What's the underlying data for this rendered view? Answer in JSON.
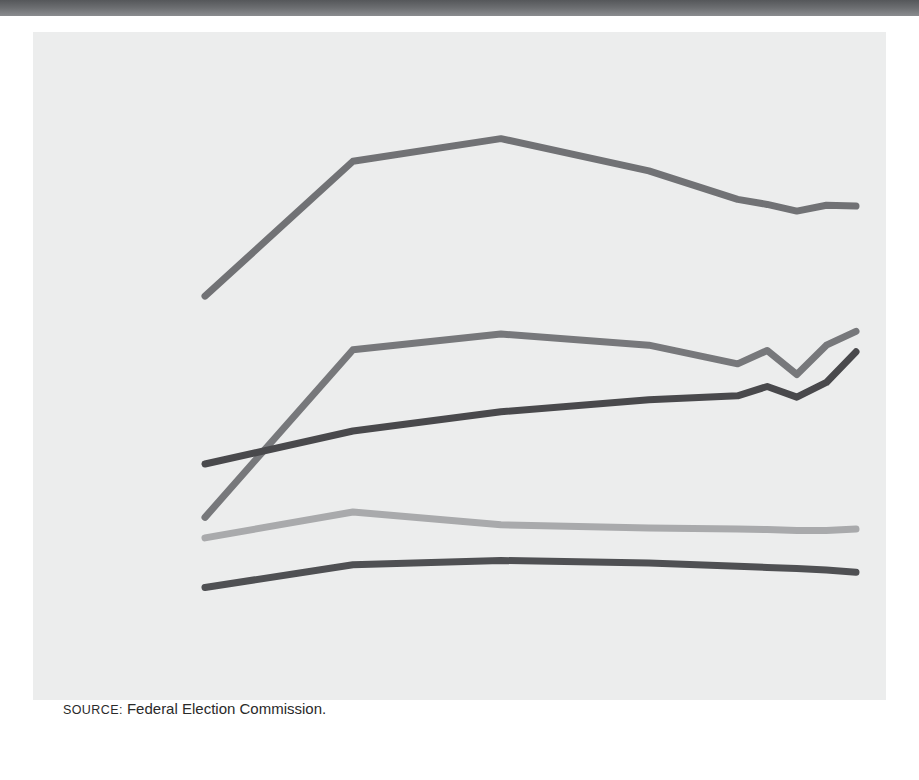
{
  "figure": {
    "source_prefix": "SOURCE:",
    "source_text": "Federal Election Commission.",
    "panel_color": "#eceded",
    "rule_color": "#6a6c6f"
  },
  "chart_data": {
    "type": "line",
    "title": "",
    "xlabel": "YEAR",
    "ylabel_line1": "NUMBER",
    "ylabel_line2": "OF PACS",
    "ylabel": "NUMBER OF PACS",
    "x": [
      1980,
      1985,
      1990,
      1995,
      1998,
      1999,
      2000,
      2001,
      2002
    ],
    "xtick_values": [
      1980,
      1985,
      1990,
      1995,
      1998,
      1999,
      2000,
      2001,
      2002
    ],
    "xtick_labels": [
      "1980",
      "1985",
      "1990",
      "1995",
      "1998",
      "",
      "2000",
      "",
      "2002"
    ],
    "xlim": [
      1980,
      2002
    ],
    "ytick_values": [
      0,
      500,
      1000,
      1500,
      2000
    ],
    "ytick_labels": [
      "0",
      "500",
      "1,000",
      "1,500",
      "2,000"
    ],
    "ylim": [
      0,
      2000
    ],
    "grid": false,
    "legend": "inline-labels",
    "series": [
      {
        "name": "Corporate",
        "color": "#717275",
        "width": 7,
        "label_x": 1988.6,
        "label_y": 1860,
        "label_anchor": "middle",
        "values": [
          1204,
          1710,
          1795,
          1674,
          1567,
          1548,
          1523,
          1545,
          1542
        ]
      },
      {
        "name": "Public interest/",
        "name_line2": "Ideological",
        "color": "#77787b",
        "width": 7,
        "label_x": 1986.0,
        "label_y": 1265,
        "label_anchor": "middle",
        "values": [
          374,
          1003,
          1062,
          1020,
          950,
          1000,
          910,
          1020,
          1072
        ]
      },
      {
        "name": "Trade",
        "color": "#49494c",
        "width": 7,
        "label_x": 1986.6,
        "label_y": 830,
        "label_anchor": "middle",
        "values": [
          574,
          698,
          770,
          815,
          830,
          865,
          825,
          880,
          995
        ]
      },
      {
        "name": "Labor",
        "color": "#a9aaac",
        "width": 7,
        "label_x": 1986.9,
        "label_y": 500,
        "label_anchor": "middle",
        "values": [
          297,
          394,
          346,
          334,
          330,
          328,
          325,
          325,
          330
        ]
      },
      {
        "name": "Other",
        "color": "#4f5053",
        "width": 7,
        "label_x": 1987.2,
        "label_y": 128,
        "label_anchor": "middle",
        "values": [
          111,
          196,
          212,
          203,
          190,
          186,
          182,
          176,
          168
        ]
      }
    ]
  }
}
